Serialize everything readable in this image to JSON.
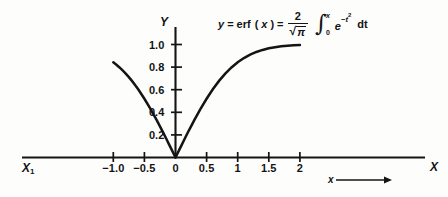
{
  "figure": {
    "background": "#fdfdfc",
    "ink": "#141414",
    "axis_name_y": "Y",
    "axis_name_x": "X",
    "origin_label_left": "X",
    "origin_label_left_sub": "1",
    "x_arrow_label": "x",
    "x_arrow_glyph": "⟶"
  },
  "formula": {
    "lhs_y": "y",
    "eq1": "=",
    "erf": "erf",
    "erf_arg_open": "(",
    "erf_arg": "x",
    "erf_arg_close": ")",
    "eq2": "=",
    "frac_num": "2",
    "sqrt_sign": "√",
    "frac_den_radicand": "π",
    "integral_sign": "∫",
    "limit_upper": "x",
    "limit_lower": "0",
    "integrand_base": "e",
    "integrand_exp_minus": "−",
    "integrand_exp_var": "t",
    "integrand_exp_pow": "2",
    "differential": "dt",
    "plain_text": "y = erf(x) = (2/√π) ∫₀ˣ e⁻ᵗ² dt"
  },
  "chart_data": {
    "type": "line",
    "title": "",
    "subtitle": "",
    "xlabel": "x",
    "ylabel": "Y",
    "xlim": [
      -1.25,
      2.2
    ],
    "ylim": [
      0,
      1.13
    ],
    "grid": false,
    "legend_position": "none",
    "x_ticks": [
      {
        "value": -1.0,
        "label": "−1.0"
      },
      {
        "value": -0.5,
        "label": "−0.5"
      },
      {
        "value": 0,
        "label": "0"
      },
      {
        "value": 0.5,
        "label": "0.5"
      },
      {
        "value": 1.0,
        "label": "1"
      },
      {
        "value": 1.5,
        "label": "1.5"
      },
      {
        "value": 2.0,
        "label": "2"
      }
    ],
    "y_ticks": [
      {
        "value": 0.2,
        "label": "0.2"
      },
      {
        "value": 0.4,
        "label": "0.4"
      },
      {
        "value": 0.6,
        "label": "0.6"
      },
      {
        "value": 0.8,
        "label": "0.8"
      },
      {
        "value": 1.0,
        "label": "1.0"
      }
    ],
    "series": [
      {
        "name": "erf(x), x ≥ 0",
        "x": [
          0,
          0.05,
          0.1,
          0.15,
          0.2,
          0.25,
          0.3,
          0.4,
          0.5,
          0.6,
          0.7,
          0.8,
          0.9,
          1.0,
          1.1,
          1.2,
          1.3,
          1.4,
          1.5,
          1.6,
          1.7,
          1.8,
          1.9,
          2.0
        ],
        "values": [
          0,
          0.056,
          0.112,
          0.168,
          0.223,
          0.276,
          0.329,
          0.428,
          0.52,
          0.604,
          0.678,
          0.742,
          0.797,
          0.843,
          0.88,
          0.91,
          0.934,
          0.952,
          0.966,
          0.976,
          0.984,
          0.989,
          0.993,
          0.995
        ]
      },
      {
        "name": "|erf(x)|, x ≤ 0",
        "x": [
          -1.0,
          -0.95,
          -0.9,
          -0.85,
          -0.8,
          -0.75,
          -0.7,
          -0.65,
          -0.6,
          -0.5,
          -0.4,
          -0.3,
          -0.25,
          -0.2,
          -0.15,
          -0.1,
          -0.05,
          0
        ],
        "values": [
          0.843,
          0.821,
          0.797,
          0.771,
          0.742,
          0.711,
          0.678,
          0.642,
          0.604,
          0.52,
          0.428,
          0.329,
          0.276,
          0.223,
          0.168,
          0.112,
          0.056,
          0
        ]
      }
    ]
  }
}
